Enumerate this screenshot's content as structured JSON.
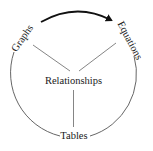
{
  "diagram": {
    "center_label": "Relationships",
    "nodes": [
      {
        "id": "graphs",
        "label": "Graphs"
      },
      {
        "id": "equations",
        "label": "Equations"
      },
      {
        "id": "tables",
        "label": "Tables"
      }
    ],
    "arrow": {
      "from": "Graphs",
      "to": "Equations"
    },
    "colors": {
      "stroke": "#555555",
      "arrow": "#111111",
      "text": "#1a1a1a"
    }
  }
}
